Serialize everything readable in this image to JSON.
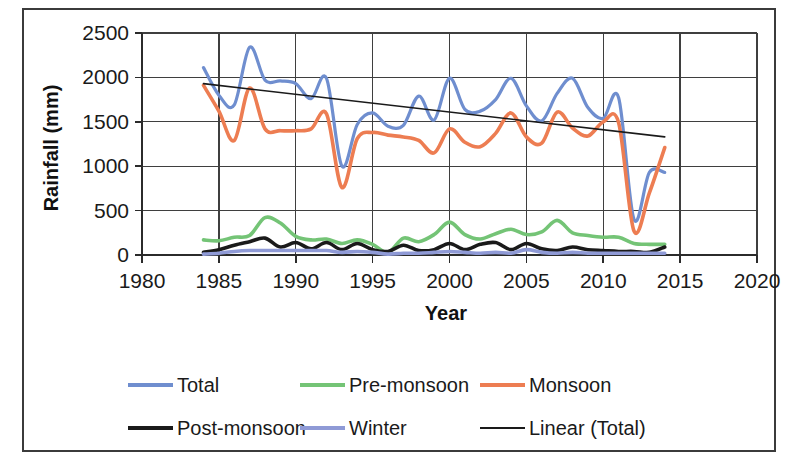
{
  "chart_data": {
    "type": "line",
    "title": "",
    "xlabel": "Year",
    "ylabel": "Rainfall (mm)",
    "xlim": [
      1980,
      2020
    ],
    "ylim": [
      0,
      2500
    ],
    "xticks": [
      1980,
      1985,
      1990,
      1995,
      2000,
      2005,
      2010,
      2015,
      2020
    ],
    "yticks": [
      0,
      500,
      1000,
      1500,
      2000,
      2500
    ],
    "xtick_labels": [
      "1980",
      "1985",
      "1990",
      "1995",
      "2000",
      "2005",
      "2010",
      "2015",
      "2020"
    ],
    "ytick_labels": [
      "0",
      "500",
      "1000",
      "1500",
      "2000",
      "2500"
    ],
    "grid": true,
    "legend_position": "bottom",
    "x": [
      1984,
      1985,
      1986,
      1987,
      1988,
      1989,
      1990,
      1991,
      1992,
      1993,
      1994,
      1995,
      1996,
      1997,
      1998,
      1999,
      2000,
      2001,
      2002,
      2003,
      2004,
      2005,
      2006,
      2007,
      2008,
      2009,
      2010,
      2011,
      2012,
      2013,
      2014
    ],
    "series": [
      {
        "name": "Total",
        "color": "#6f8ecf",
        "width": 3.2,
        "values": [
          2110,
          1800,
          1690,
          2340,
          1970,
          1960,
          1930,
          1760,
          1990,
          1000,
          1470,
          1600,
          1450,
          1460,
          1790,
          1520,
          1990,
          1640,
          1620,
          1750,
          1990,
          1680,
          1510,
          1820,
          1990,
          1660,
          1540,
          1770,
          400,
          930,
          930
        ]
      },
      {
        "name": "Pre-monsoon",
        "color": "#74c476",
        "width": 3.6,
        "values": [
          170,
          160,
          200,
          220,
          420,
          360,
          210,
          170,
          180,
          130,
          170,
          120,
          30,
          190,
          150,
          230,
          370,
          230,
          180,
          240,
          290,
          230,
          260,
          390,
          250,
          220,
          200,
          200,
          130,
          120,
          120
        ]
      },
      {
        "name": "Monsoon",
        "color": "#ed7d52",
        "width": 3.6,
        "values": [
          1910,
          1620,
          1290,
          1880,
          1420,
          1400,
          1400,
          1420,
          1590,
          760,
          1310,
          1380,
          1350,
          1330,
          1290,
          1150,
          1420,
          1270,
          1220,
          1370,
          1600,
          1330,
          1260,
          1610,
          1430,
          1340,
          1500,
          1490,
          270,
          700,
          1210
        ]
      },
      {
        "name": "Post-monsoon",
        "color": "#1a1a1a",
        "width": 3.6,
        "values": [
          30,
          60,
          110,
          150,
          190,
          90,
          140,
          70,
          140,
          60,
          130,
          60,
          40,
          110,
          50,
          60,
          130,
          60,
          120,
          140,
          60,
          130,
          70,
          50,
          90,
          60,
          50,
          40,
          40,
          30,
          90
        ]
      },
      {
        "name": "Winter",
        "color": "#8f9ad6",
        "width": 3.6,
        "values": [
          10,
          20,
          40,
          50,
          50,
          50,
          50,
          50,
          50,
          30,
          40,
          30,
          10,
          20,
          20,
          30,
          40,
          30,
          20,
          30,
          20,
          60,
          30,
          20,
          30,
          20,
          20,
          20,
          20,
          20,
          20
        ]
      }
    ],
    "trendline": {
      "name": "Linear (Total)",
      "color": "#1a1a1a",
      "x": [
        1984,
        2014
      ],
      "values": [
        1930,
        1330
      ]
    },
    "legend": [
      {
        "label": "Total",
        "color": "#6f8ecf",
        "style": "thick"
      },
      {
        "label": "Pre-monsoon",
        "color": "#74c476",
        "style": "thick"
      },
      {
        "label": "Monsoon",
        "color": "#ed7d52",
        "style": "thick"
      },
      {
        "label": "Post-monsoon",
        "color": "#1a1a1a",
        "style": "thick"
      },
      {
        "label": "Winter",
        "color": "#8f9ad6",
        "style": "thick"
      },
      {
        "label": "Linear (Total)",
        "color": "#1a1a1a",
        "style": "thin"
      }
    ]
  },
  "figure": {
    "border_color": "#3b3b3b",
    "background": "#ffffff"
  }
}
